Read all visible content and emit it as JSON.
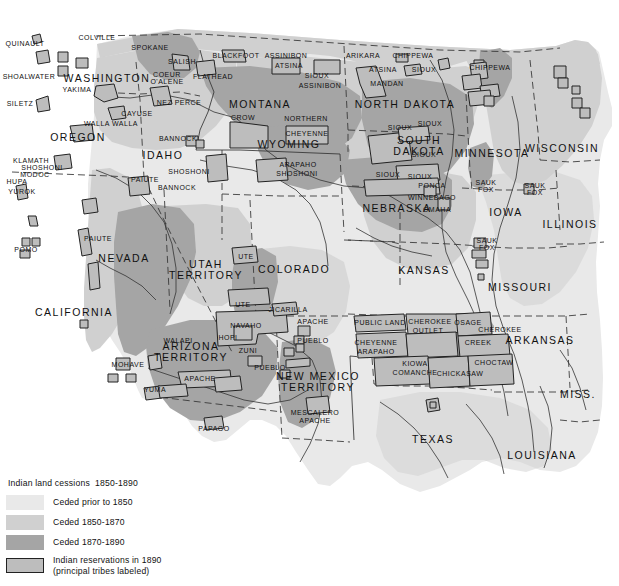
{
  "map": {
    "title": "Indian land cessions 1850-1890",
    "palette": {
      "ocean": "#ffffff",
      "ceded_prior_1850": "#e9e9e9",
      "ceded_1850_1870": "#d0d0d0",
      "ceded_1870_1890": "#a5a5a5",
      "reservation_fill": "#bdbdbd",
      "outline": "#222222",
      "text": "#111111"
    },
    "legend": {
      "title": "Indian land cessions  1850-1890",
      "items": [
        {
          "swatch": "ceded-prior-1850",
          "label": "Ceded prior to 1850"
        },
        {
          "swatch": "ceded-1850-1870",
          "label": "Ceded 1850-1870"
        },
        {
          "swatch": "ceded-1870-1890",
          "label": "Ceded 1870-1890"
        },
        {
          "swatch": "reservations-1890",
          "label": "Indian reservations in 1890\n(principal tribes labeled)"
        }
      ]
    },
    "states": [
      {
        "name": "WASHINGTON",
        "x": 107,
        "y": 78
      },
      {
        "name": "OREGON",
        "x": 78,
        "y": 137
      },
      {
        "name": "IDAHO",
        "x": 163,
        "y": 155
      },
      {
        "name": "MONTANA",
        "x": 260,
        "y": 104
      },
      {
        "name": "WYOMING",
        "x": 289,
        "y": 144
      },
      {
        "name": "NORTH DAKOTA",
        "x": 405,
        "y": 104
      },
      {
        "name": "SOUTH\nDAKOTA",
        "x": 419,
        "y": 146
      },
      {
        "name": "MINNESOTA",
        "x": 492,
        "y": 153
      },
      {
        "name": "WISCONSIN",
        "x": 562,
        "y": 148
      },
      {
        "name": "NEBRASKA",
        "x": 397,
        "y": 208
      },
      {
        "name": "IOWA",
        "x": 506,
        "y": 212
      },
      {
        "name": "ILLINOIS",
        "x": 570,
        "y": 224
      },
      {
        "name": "NEVADA",
        "x": 124,
        "y": 258
      },
      {
        "name": "UTAH\nTERRITORY",
        "x": 206,
        "y": 270
      },
      {
        "name": "COLORADO",
        "x": 294,
        "y": 269
      },
      {
        "name": "KANSAS",
        "x": 424,
        "y": 270
      },
      {
        "name": "MISSOURI",
        "x": 520,
        "y": 287
      },
      {
        "name": "CALIFORNIA",
        "x": 74,
        "y": 312
      },
      {
        "name": "ARIZONA\nTERRITORY",
        "x": 191,
        "y": 352
      },
      {
        "name": "NEW MEXICO\nTERRITORY",
        "x": 318,
        "y": 382
      },
      {
        "name": "ARKANSAS",
        "x": 540,
        "y": 340
      },
      {
        "name": "TEXAS",
        "x": 433,
        "y": 439
      },
      {
        "name": "LOUISIANA",
        "x": 542,
        "y": 455
      },
      {
        "name": "MISS.",
        "x": 578,
        "y": 394
      }
    ],
    "tribes": [
      {
        "name": "QUINAULT",
        "x": 25,
        "y": 44
      },
      {
        "name": "SHOALWATER",
        "x": 29,
        "y": 77
      },
      {
        "name": "SILETZ",
        "x": 20,
        "y": 104
      },
      {
        "name": "COLVILLE",
        "x": 97,
        "y": 38
      },
      {
        "name": "SPOKANE",
        "x": 150,
        "y": 48
      },
      {
        "name": "SALISH",
        "x": 182,
        "y": 62
      },
      {
        "name": "COEUR\nO'ALENE",
        "x": 167,
        "y": 78
      },
      {
        "name": "FLATHEAD",
        "x": 213,
        "y": 77
      },
      {
        "name": "YAKIMA",
        "x": 77,
        "y": 90
      },
      {
        "name": "NEZ PERCE",
        "x": 179,
        "y": 103
      },
      {
        "name": "CAYUSE",
        "x": 137,
        "y": 114
      },
      {
        "name": "WALLA WALLA",
        "x": 111,
        "y": 124
      },
      {
        "name": "BLACKFOOT",
        "x": 236,
        "y": 56
      },
      {
        "name": "ASSINIBON",
        "x": 286,
        "y": 56
      },
      {
        "name": "ATSINA",
        "x": 289,
        "y": 66
      },
      {
        "name": "SIOUX",
        "x": 317,
        "y": 76
      },
      {
        "name": "ASSINIBON",
        "x": 320,
        "y": 86
      },
      {
        "name": "ARIKARA",
        "x": 363,
        "y": 56
      },
      {
        "name": "CHIPPEWA",
        "x": 413,
        "y": 56
      },
      {
        "name": "ATSINA",
        "x": 383,
        "y": 70
      },
      {
        "name": "SIOUX",
        "x": 424,
        "y": 70
      },
      {
        "name": "MANDAN",
        "x": 387,
        "y": 84
      },
      {
        "name": "CHIPPEWA",
        "x": 490,
        "y": 68
      },
      {
        "name": "CROW",
        "x": 243,
        "y": 118
      },
      {
        "name": "NORTHERN",
        "x": 306,
        "y": 119
      },
      {
        "name": "CHEYENNE",
        "x": 307,
        "y": 134
      },
      {
        "name": "BANNOCK",
        "x": 178,
        "y": 139
      },
      {
        "name": "SHOSHONI",
        "x": 189,
        "y": 172
      },
      {
        "name": "BANNOCK",
        "x": 177,
        "y": 188
      },
      {
        "name": "PAIUTE",
        "x": 145,
        "y": 180
      },
      {
        "name": "ARAPAHO",
        "x": 298,
        "y": 165
      },
      {
        "name": "SHOSHONI",
        "x": 297,
        "y": 174
      },
      {
        "name": "SIOUX",
        "x": 400,
        "y": 128
      },
      {
        "name": "SIOUX",
        "x": 430,
        "y": 124
      },
      {
        "name": "SIOUX",
        "x": 424,
        "y": 155
      },
      {
        "name": "SIOUX",
        "x": 420,
        "y": 177
      },
      {
        "name": "SIOUX",
        "x": 388,
        "y": 175
      },
      {
        "name": "PONCA",
        "x": 432,
        "y": 186
      },
      {
        "name": "WINNEBAGO",
        "x": 432,
        "y": 198
      },
      {
        "name": "OMAHA",
        "x": 437,
        "y": 210
      },
      {
        "name": "SAUK\nFOX",
        "x": 535,
        "y": 189
      },
      {
        "name": "SAUK\nFOX",
        "x": 487,
        "y": 244
      },
      {
        "name": "KLAMATH",
        "x": 31,
        "y": 161
      },
      {
        "name": "SHOSHONI",
        "x": 42,
        "y": 168
      },
      {
        "name": "MODOC",
        "x": 35,
        "y": 175
      },
      {
        "name": "HUPA",
        "x": 17,
        "y": 182
      },
      {
        "name": "YUROK",
        "x": 22,
        "y": 192
      },
      {
        "name": "POMO",
        "x": 26,
        "y": 250
      },
      {
        "name": "PAIUTE",
        "x": 98,
        "y": 239
      },
      {
        "name": "UTE",
        "x": 246,
        "y": 257
      },
      {
        "name": "UTE",
        "x": 243,
        "y": 305
      },
      {
        "name": "JICARILLA",
        "x": 288,
        "y": 310
      },
      {
        "name": "APACHE",
        "x": 313,
        "y": 322
      },
      {
        "name": "NAVAHO",
        "x": 246,
        "y": 326
      },
      {
        "name": "HOPI",
        "x": 228,
        "y": 338
      },
      {
        "name": "ZUNI",
        "x": 248,
        "y": 351
      },
      {
        "name": "PUEBLO",
        "x": 313,
        "y": 341
      },
      {
        "name": "PUEBLO",
        "x": 270,
        "y": 368
      },
      {
        "name": "WALAPI",
        "x": 178,
        "y": 341
      },
      {
        "name": "MOHAVE",
        "x": 128,
        "y": 365
      },
      {
        "name": "APACHE",
        "x": 200,
        "y": 379
      },
      {
        "name": "YUMA",
        "x": 155,
        "y": 390
      },
      {
        "name": "PAPAGO",
        "x": 214,
        "y": 429
      },
      {
        "name": "MESCALERO",
        "x": 315,
        "y": 413
      },
      {
        "name": "APACHE",
        "x": 315,
        "y": 421
      },
      {
        "name": "PUBLIC LAND",
        "x": 380,
        "y": 323
      },
      {
        "name": "CHEROKEE",
        "x": 430,
        "y": 322
      },
      {
        "name": "OUTLET",
        "x": 428,
        "y": 331
      },
      {
        "name": "OSAGE",
        "x": 468,
        "y": 323
      },
      {
        "name": "CHEROKEE",
        "x": 500,
        "y": 330
      },
      {
        "name": "CREEK",
        "x": 478,
        "y": 343
      },
      {
        "name": "CHEYENNE",
        "x": 376,
        "y": 343
      },
      {
        "name": "ARAPAHO",
        "x": 376,
        "y": 352
      },
      {
        "name": "KIOWA",
        "x": 415,
        "y": 364
      },
      {
        "name": "COMANCHE",
        "x": 415,
        "y": 373
      },
      {
        "name": "CHICKASAW",
        "x": 460,
        "y": 374
      },
      {
        "name": "CHOCTAW",
        "x": 494,
        "y": 363
      },
      {
        "name": "SAUK\nFOX",
        "x": 486,
        "y": 186
      }
    ]
  }
}
